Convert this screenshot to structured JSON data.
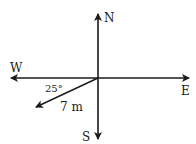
{
  "diagram": {
    "type": "compass-vector",
    "directions": {
      "north": "N",
      "south": "S",
      "east": "E",
      "west": "W"
    },
    "vector": {
      "magnitude_label": "7 m",
      "angle_label": "25°",
      "angle_reference": "below West axis"
    },
    "colors": {
      "stroke": "#1a1a1a",
      "background": "#ffffff"
    }
  }
}
